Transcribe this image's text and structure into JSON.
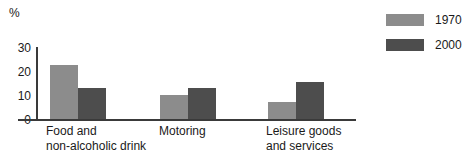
{
  "chart_data": {
    "type": "bar",
    "title": "",
    "subtitle": "",
    "xlabel": "",
    "ylabel": "%",
    "unit_label": "%",
    "categories": [
      "Food and\nnon-alcoholic drink",
      "Motoring",
      "Leisure goods\nand services"
    ],
    "series": [
      {
        "name": "1970",
        "color": "#8c8c8c",
        "values": [
          22.5,
          10,
          7
        ]
      },
      {
        "name": "2000",
        "color": "#4d4d4d",
        "values": [
          13,
          13,
          15.5
        ]
      }
    ],
    "ylim": [
      0,
      30
    ],
    "yticks": [
      0,
      10,
      20,
      30
    ],
    "ytick_labels": [
      "0",
      "10",
      "20",
      "30"
    ],
    "grid": false,
    "legend_position": "top-right"
  },
  "legend": {
    "entries": [
      {
        "label": "1970",
        "swatch_color": "#8c8c8c"
      },
      {
        "label": "2000",
        "swatch_color": "#4d4d4d"
      }
    ]
  },
  "axis": {
    "unit": "%",
    "tick_0": "0",
    "tick_10": "10",
    "tick_20": "20",
    "tick_30": "30"
  },
  "categories_text": {
    "cat0_line1": "Food and",
    "cat0_line2": "non-alcoholic drink",
    "cat1_line1": "Motoring",
    "cat2_line1": "Leisure goods",
    "cat2_line2": "and services"
  },
  "colors": {
    "series_1970": "#8c8c8c",
    "series_2000": "#4d4d4d",
    "axis": "#3a3a3a",
    "text": "#1a1a1a",
    "background": "#ffffff"
  }
}
